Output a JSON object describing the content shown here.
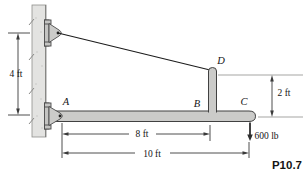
{
  "figure": {
    "number": "P10.7",
    "kind": "statics-problem-diagram"
  },
  "points": {
    "A": "A",
    "B": "B",
    "C": "C",
    "D": "D"
  },
  "dimensions": {
    "wall_vertical": "4 ft",
    "post_height": "2 ft",
    "span_a_to_b": "8 ft",
    "span_a_to_c": "10 ft"
  },
  "load": {
    "label": "600 lb",
    "direction": "down"
  },
  "colors": {
    "member_fill": "#cbcbc9",
    "wall_fill": "#e3e3e1",
    "outline": "#414141",
    "dimension_line": "#3a3a3a",
    "extension_line": "#9b9b98",
    "cable": "#1c1c1c"
  }
}
